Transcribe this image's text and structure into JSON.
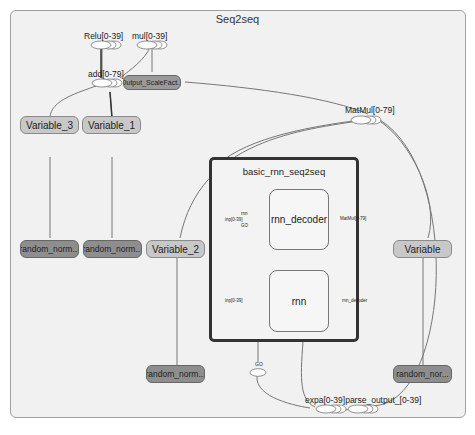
{
  "graph": {
    "title": "Seq2seq",
    "nodes": {
      "relu": "Relu[0-39]",
      "mul": "mul[0-39]",
      "add": "add[0-79]",
      "output_scale": "Output_ScaleFact...",
      "matmul": "MatMul[0-79]",
      "variable_3": "Variable_3",
      "variable_1": "Variable_1",
      "variable_2": "Variable_2",
      "variable": "Variable",
      "random_norm_1": "random_norm...",
      "random_norm_2": "random_norm...",
      "random_norm_3": "random_norm...",
      "random_nor_4": "random_nor...",
      "go": "GO",
      "expand_parse": "expa[0-39]parse_output_[0-39]"
    },
    "group": {
      "title": "basic_rnn_seq2seq",
      "rnn_decoder": {
        "label": "rnn_decoder",
        "inputs": [
          "rnn",
          "inp[0-39]",
          "GO"
        ],
        "output": "MatMul[0-79]"
      },
      "rnn": {
        "label": "rnn",
        "inputs": [
          "inp[0-39]"
        ],
        "output": "rnn_decoder"
      }
    }
  }
}
